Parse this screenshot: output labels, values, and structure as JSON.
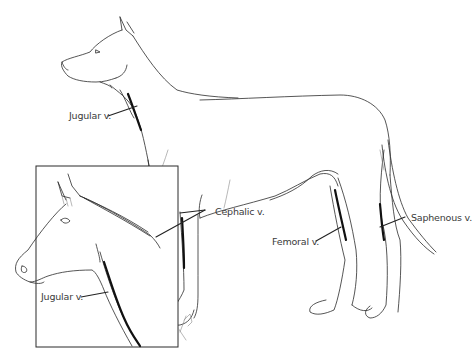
{
  "figure": {
    "labels": {
      "dog_jugular": "Jugular v.",
      "cephalic": "Cephalic v.",
      "femoral": "Femoral v.",
      "saphenous": "Saphenous v.",
      "horse_jugular": "Jugular v."
    },
    "colors": {
      "line": "#2b2b2b",
      "vein": "#111111",
      "text": "#3a3a3a",
      "background": "#ffffff"
    }
  }
}
